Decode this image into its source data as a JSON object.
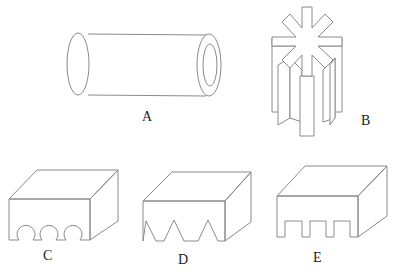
{
  "figure": {
    "shapes": [
      {
        "id": "A",
        "label": "A",
        "type": "hollow cylinder (tube)"
      },
      {
        "id": "B",
        "label": "B",
        "type": "eight-pointed star prism"
      },
      {
        "id": "C",
        "label": "C",
        "type": "rectangular block with three semicircular grooves"
      },
      {
        "id": "D",
        "label": "D",
        "type": "rectangular block with three triangular notches"
      },
      {
        "id": "E",
        "label": "E",
        "type": "rectangular block with three rectangular notches"
      }
    ],
    "colors": {
      "stroke": "#8a8a8a",
      "text": "#222222",
      "background": "#ffffff"
    }
  }
}
